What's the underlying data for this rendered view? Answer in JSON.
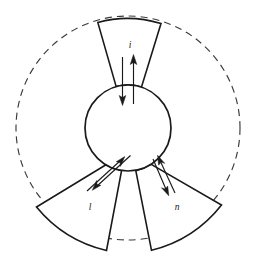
{
  "figure": {
    "background_color": "#ffffff",
    "stroke_color": "#1a1a1a",
    "dashed_stroke_color": "#3a3a3a",
    "geometry": {
      "center_x": 128,
      "center_y": 128,
      "core_radius": 43,
      "outer_dashed_radius": 112,
      "sector_outer_radius_top": 112,
      "sector_outer_radius_bottom": 128
    },
    "sectors": [
      {
        "id": "sector-top",
        "label": "i",
        "label_x": 130,
        "label_y": 46,
        "position": "top"
      },
      {
        "id": "sector-bottom-left",
        "label": "l",
        "label_x": 90,
        "label_y": 208,
        "position": "bottom-left"
      },
      {
        "id": "sector-bottom-right",
        "label": "n",
        "label_x": 177,
        "label_y": 208,
        "position": "bottom-right"
      }
    ],
    "arrows": [
      {
        "id": "arrow-top-inward",
        "direction": "inward",
        "sector": "sector-top"
      },
      {
        "id": "arrow-top-outward",
        "direction": "outward",
        "sector": "sector-top"
      },
      {
        "id": "arrow-bottom-left-outward",
        "direction": "outward",
        "sector": "sector-bottom-left"
      },
      {
        "id": "arrow-bottom-left-inward",
        "direction": "inward",
        "sector": "sector-bottom-left"
      },
      {
        "id": "arrow-bottom-right-outward",
        "direction": "outward",
        "sector": "sector-bottom-right"
      },
      {
        "id": "arrow-bottom-right-inward",
        "direction": "inward",
        "sector": "sector-bottom-right"
      }
    ]
  }
}
